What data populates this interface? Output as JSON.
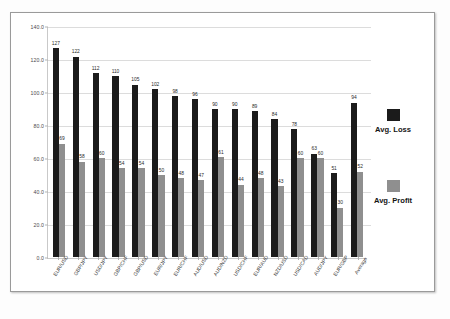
{
  "chart_data": {
    "type": "bar",
    "title": "",
    "subtitle": "",
    "xlabel": "",
    "ylabel": "",
    "ylim": [
      0,
      140
    ],
    "yticks": [
      "0.0",
      "20.0",
      "40.0",
      "60.0",
      "80.0",
      "100.0",
      "120.0",
      "140.0"
    ],
    "ytick_values": [
      0,
      20,
      40,
      60,
      80,
      100,
      120,
      140
    ],
    "grid": true,
    "legend_position": "right",
    "categories": [
      "EUR/USD",
      "GBP/JPY",
      "USD/JPY",
      "GBP/CHF",
      "GBP/USD",
      "EUR/JPY",
      "EUR/CHF",
      "AUD/USD",
      "AUD/NZD",
      "USD/CHF",
      "EUR/AUD",
      "NZD/USD",
      "USD/CAD",
      "AUD/JPY",
      "EUR/GBP",
      "Average"
    ],
    "series": [
      {
        "name": "Avg. Loss",
        "color": "#1b1b1b",
        "values": [
          127,
          122,
          112,
          110,
          105,
          102,
          98,
          96,
          90,
          90,
          89,
          84,
          78,
          63,
          51,
          94
        ]
      },
      {
        "name": "Avg. Profit",
        "color": "#8f8f8f",
        "values": [
          69,
          58,
          60,
          54,
          54,
          50,
          48,
          47,
          61,
          44,
          48,
          43,
          60,
          60,
          30,
          52
        ]
      }
    ]
  },
  "legend": {
    "items": [
      {
        "label": "Avg. Loss",
        "swatch": "loss"
      },
      {
        "label": "Avg. Profit",
        "swatch": "profit"
      }
    ]
  }
}
